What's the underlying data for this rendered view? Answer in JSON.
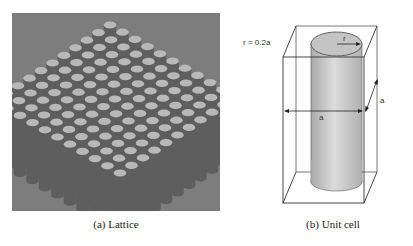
{
  "figure": {
    "panels": [
      {
        "id": "a",
        "caption": "(a) Lattice",
        "description": "3D render of a square array of vertical cylinders",
        "grid": {
          "rows": 11,
          "cols": 11
        },
        "colors": {
          "background": "#7d7d7d",
          "cylinder_top": "#b8b8b8",
          "cylinder_side": "#5e5e5e"
        }
      },
      {
        "id": "b",
        "caption": "(b) Unit cell",
        "annotations": {
          "radius_relation": "r = 0.2a",
          "radius_label": "r",
          "width_label": "a",
          "depth_label": "a"
        },
        "colors": {
          "cylinder": "#c8c8c8",
          "edges": "#333333"
        }
      }
    ]
  }
}
